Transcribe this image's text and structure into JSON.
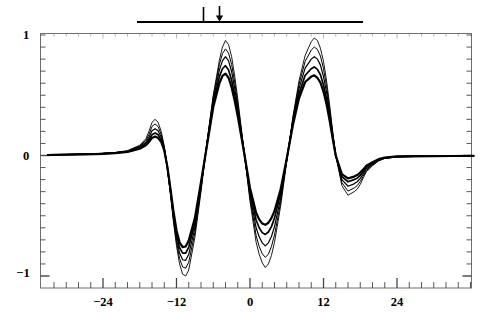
{
  "chart_data": {
    "type": "line",
    "title": "",
    "subtitle": "",
    "xlabel": "",
    "ylabel": "",
    "xlim": [
      -33,
      36.5
    ],
    "ylim": [
      -1.03,
      1.03
    ],
    "xticks": [
      -24,
      -12,
      0,
      12,
      24
    ],
    "xtick_labels": [
      "−24",
      "−12",
      "0",
      "12",
      "24"
    ],
    "yticks": [
      -1,
      0,
      1
    ],
    "ytick_labels": [
      "−1",
      "0",
      "1"
    ],
    "minor_tick_interval": 2,
    "grid": false,
    "legend": false,
    "legend_position": "none",
    "line_color": "#000000",
    "frame_color": "#555555",
    "background": "#ffffff",
    "annotations": [
      {
        "name": "span-bar",
        "kind": "horizontal-bar",
        "x_start": -18.5,
        "x_end": 18.5,
        "y_pixel": 22,
        "color": "#000000"
      },
      {
        "name": "tick-marker",
        "kind": "vertical-tick",
        "x": -7.7,
        "color": "#000000"
      },
      {
        "name": "down-arrow-marker",
        "kind": "down-arrow",
        "x": -5.1,
        "color": "#000000"
      }
    ],
    "series": [
      {
        "name": "trace-1",
        "amplitude_scale": 1.0,
        "x": [
          -33,
          -30,
          -27,
          -24,
          -22,
          -20,
          -18,
          -17,
          -16.5,
          -16,
          -15.5,
          -15,
          -14.5,
          -14,
          -13.5,
          -13,
          -12.5,
          -12,
          -11.5,
          -11,
          -10.5,
          -10,
          -9,
          -8,
          -7,
          -6,
          -5,
          -4.5,
          -4,
          -3.5,
          -3,
          -2.5,
          -2,
          -1,
          0,
          1,
          1.5,
          2,
          2.5,
          3,
          3.5,
          4,
          5,
          6,
          7,
          8,
          9,
          10,
          10.5,
          11,
          11.5,
          12,
          12.5,
          13,
          13.5,
          14,
          15,
          16,
          17,
          17.5,
          18,
          18.5,
          19,
          20,
          21,
          22,
          24,
          27,
          30,
          33,
          36.5
        ],
        "y": [
          0.005,
          0.008,
          0.012,
          0.018,
          0.025,
          0.04,
          0.085,
          0.14,
          0.2,
          0.275,
          0.3,
          0.275,
          0.2,
          0.08,
          -0.1,
          -0.32,
          -0.55,
          -0.75,
          -0.9,
          -0.985,
          -1.0,
          -0.95,
          -0.68,
          -0.3,
          0.12,
          0.5,
          0.79,
          0.9,
          0.955,
          0.92,
          0.82,
          0.66,
          0.47,
          0.05,
          -0.38,
          -0.72,
          -0.82,
          -0.89,
          -0.93,
          -0.9,
          -0.83,
          -0.72,
          -0.42,
          -0.05,
          0.32,
          0.62,
          0.83,
          0.945,
          0.975,
          0.955,
          0.89,
          0.78,
          0.62,
          0.42,
          0.2,
          0.0,
          -0.25,
          -0.33,
          -0.3,
          -0.28,
          -0.24,
          -0.185,
          -0.135,
          -0.085,
          -0.045,
          -0.025,
          -0.012,
          -0.008,
          -0.006,
          -0.005,
          -0.004
        ]
      },
      {
        "name": "trace-2",
        "amplitude_scale": 0.93,
        "x": [
          -33,
          -30,
          -27,
          -24,
          -22,
          -20,
          -18,
          -17,
          -16.5,
          -16,
          -15.5,
          -15,
          -14.5,
          -14,
          -13.5,
          -13,
          -12.5,
          -12,
          -11.5,
          -11,
          -10.5,
          -10,
          -9,
          -8,
          -7,
          -6,
          -5,
          -4.5,
          -4,
          -3.5,
          -3,
          -2.5,
          -2,
          -1,
          0,
          1,
          1.5,
          2,
          2.5,
          3,
          3.5,
          4,
          5,
          6,
          7,
          8,
          9,
          10,
          10.5,
          11,
          11.5,
          12,
          12.5,
          13,
          13.5,
          14,
          15,
          16,
          17,
          17.5,
          18,
          18.5,
          19,
          20,
          21,
          22,
          24,
          27,
          30,
          33,
          36.5
        ],
        "y": [
          0.005,
          0.008,
          0.012,
          0.018,
          0.024,
          0.038,
          0.08,
          0.125,
          0.175,
          0.24,
          0.262,
          0.24,
          0.175,
          0.07,
          -0.1,
          -0.31,
          -0.53,
          -0.72,
          -0.855,
          -0.925,
          -0.935,
          -0.885,
          -0.64,
          -0.28,
          0.12,
          0.49,
          0.755,
          0.845,
          0.885,
          0.85,
          0.755,
          0.61,
          0.435,
          0.05,
          -0.355,
          -0.665,
          -0.755,
          -0.815,
          -0.845,
          -0.82,
          -0.755,
          -0.66,
          -0.39,
          -0.04,
          0.31,
          0.59,
          0.78,
          0.875,
          0.9,
          0.88,
          0.825,
          0.72,
          0.575,
          0.39,
          0.185,
          0.0,
          -0.225,
          -0.295,
          -0.27,
          -0.25,
          -0.215,
          -0.17,
          -0.125,
          -0.08,
          -0.042,
          -0.023,
          -0.011,
          -0.008,
          -0.006,
          -0.005,
          -0.004
        ]
      },
      {
        "name": "trace-3",
        "amplitude_scale": 0.84,
        "x": [
          -33,
          -30,
          -27,
          -24,
          -22,
          -20,
          -18,
          -17,
          -16.5,
          -16,
          -15.5,
          -15,
          -14.5,
          -14,
          -13.5,
          -13,
          -12.5,
          -12,
          -11.5,
          -11,
          -10.5,
          -10,
          -9,
          -8,
          -7,
          -6,
          -5,
          -4.5,
          -4,
          -3.5,
          -3,
          -2.5,
          -2,
          -1,
          0,
          1,
          1.5,
          2,
          2.5,
          3,
          3.5,
          4,
          5,
          6,
          7,
          8,
          9,
          10,
          10.5,
          11,
          11.5,
          12,
          12.5,
          13,
          13.5,
          14,
          15,
          16,
          17,
          17.5,
          18,
          18.5,
          19,
          20,
          21,
          22,
          24,
          27,
          30,
          33,
          36.5
        ],
        "y": [
          0.005,
          0.008,
          0.012,
          0.017,
          0.023,
          0.035,
          0.072,
          0.11,
          0.152,
          0.205,
          0.222,
          0.205,
          0.152,
          0.06,
          -0.1,
          -0.3,
          -0.51,
          -0.69,
          -0.81,
          -0.865,
          -0.87,
          -0.82,
          -0.6,
          -0.26,
          0.11,
          0.46,
          0.71,
          0.785,
          0.82,
          0.785,
          0.695,
          0.56,
          0.4,
          0.045,
          -0.33,
          -0.6,
          -0.675,
          -0.725,
          -0.75,
          -0.725,
          -0.672,
          -0.59,
          -0.355,
          -0.035,
          0.29,
          0.555,
          0.725,
          0.8,
          0.82,
          0.8,
          0.75,
          0.655,
          0.525,
          0.355,
          0.17,
          0.0,
          -0.2,
          -0.255,
          -0.235,
          -0.218,
          -0.19,
          -0.152,
          -0.112,
          -0.072,
          -0.038,
          -0.021,
          -0.01,
          -0.008,
          -0.006,
          -0.005,
          -0.004
        ]
      },
      {
        "name": "trace-4",
        "amplitude_scale": 0.74,
        "x": [
          -33,
          -30,
          -27,
          -24,
          -22,
          -20,
          -18,
          -17,
          -16.5,
          -16,
          -15.5,
          -15,
          -14.5,
          -14,
          -13.5,
          -13,
          -12.5,
          -12,
          -11.5,
          -11,
          -10.5,
          -10,
          -9,
          -8,
          -7,
          -6,
          -5,
          -4.5,
          -4,
          -3.5,
          -3,
          -2.5,
          -2,
          -1,
          0,
          1,
          1.5,
          2,
          2.5,
          3,
          3.5,
          4,
          5,
          6,
          7,
          8,
          9,
          10,
          10.5,
          11,
          11.5,
          12,
          12.5,
          13,
          13.5,
          14,
          15,
          16,
          17,
          17.5,
          18,
          18.5,
          19,
          20,
          21,
          22,
          24,
          27,
          30,
          33,
          36.5
        ],
        "y": [
          0.005,
          0.008,
          0.011,
          0.016,
          0.021,
          0.032,
          0.064,
          0.097,
          0.13,
          0.172,
          0.186,
          0.172,
          0.13,
          0.05,
          -0.095,
          -0.285,
          -0.485,
          -0.655,
          -0.765,
          -0.81,
          -0.81,
          -0.76,
          -0.56,
          -0.24,
          0.1,
          0.43,
          0.655,
          0.72,
          0.745,
          0.71,
          0.625,
          0.505,
          0.36,
          0.04,
          -0.3,
          -0.535,
          -0.6,
          -0.64,
          -0.655,
          -0.635,
          -0.59,
          -0.52,
          -0.315,
          -0.03,
          0.27,
          0.515,
          0.665,
          0.72,
          0.735,
          0.715,
          0.67,
          0.585,
          0.47,
          0.32,
          0.155,
          0.0,
          -0.175,
          -0.218,
          -0.2,
          -0.188,
          -0.165,
          -0.132,
          -0.098,
          -0.063,
          -0.034,
          -0.019,
          -0.009,
          -0.007,
          -0.005,
          -0.004,
          -0.003
        ]
      },
      {
        "name": "trace-5",
        "amplitude_scale": 0.64,
        "x": [
          -33,
          -30,
          -27,
          -24,
          -22,
          -20,
          -18,
          -17,
          -16.5,
          -16,
          -15.5,
          -15,
          -14.5,
          -14,
          -13.5,
          -13,
          -12.5,
          -12,
          -11.5,
          -11,
          -10.5,
          -10,
          -9,
          -8,
          -7,
          -6,
          -5,
          -4.5,
          -4,
          -3.5,
          -3,
          -2.5,
          -2,
          -1,
          0,
          1,
          1.5,
          2,
          2.5,
          3,
          3.5,
          4,
          5,
          6,
          7,
          8,
          9,
          10,
          10.5,
          11,
          11.5,
          12,
          12.5,
          13,
          13.5,
          14,
          15,
          16,
          17,
          17.5,
          18,
          18.5,
          19,
          20,
          21,
          22,
          24,
          27,
          30,
          33,
          36.5
        ],
        "y": [
          0.004,
          0.007,
          0.01,
          0.014,
          0.019,
          0.029,
          0.056,
          0.084,
          0.112,
          0.146,
          0.157,
          0.146,
          0.112,
          0.042,
          -0.09,
          -0.27,
          -0.46,
          -0.62,
          -0.72,
          -0.76,
          -0.755,
          -0.705,
          -0.52,
          -0.22,
          0.09,
          0.4,
          0.6,
          0.66,
          0.68,
          0.645,
          0.565,
          0.455,
          0.325,
          0.035,
          -0.27,
          -0.475,
          -0.53,
          -0.565,
          -0.575,
          -0.558,
          -0.52,
          -0.46,
          -0.28,
          -0.025,
          0.25,
          0.475,
          0.61,
          0.655,
          0.665,
          0.645,
          0.605,
          0.53,
          0.425,
          0.29,
          0.14,
          0.0,
          -0.155,
          -0.19,
          -0.175,
          -0.162,
          -0.142,
          -0.115,
          -0.085,
          -0.055,
          -0.03,
          -0.017,
          -0.008,
          -0.006,
          -0.005,
          -0.004,
          -0.003
        ]
      }
    ]
  },
  "axis": {
    "y_top_label": "1",
    "y_mid_label": "0",
    "y_bottom_label": "−1",
    "x_labels": [
      "−24",
      "−12",
      "0",
      "12",
      "24"
    ]
  }
}
